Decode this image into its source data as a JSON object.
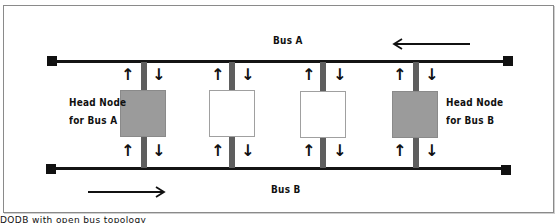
{
  "diagram": {
    "bus_a": {
      "label": "Bus A",
      "direction": "right-to-left"
    },
    "bus_b": {
      "label": "Bus B",
      "direction": "left-to-right"
    },
    "nodes": [
      {
        "id": "node-1",
        "type": "head",
        "label_line1": "Head Node",
        "label_line2": "for Bus A"
      },
      {
        "id": "node-2",
        "type": "plain"
      },
      {
        "id": "node-3",
        "type": "plain"
      },
      {
        "id": "node-4",
        "type": "head",
        "label_line1": "Head Node",
        "label_line2": "for Bus B"
      }
    ],
    "tap_up_glyph": "↑",
    "tap_down_glyph": "↓",
    "caption": "DQDB with open bus topology",
    "colors": {
      "bus": "#141414",
      "stem": "#5e5e5e",
      "head_node": "#9b9b9b",
      "plain_node": "#ffffff"
    }
  }
}
